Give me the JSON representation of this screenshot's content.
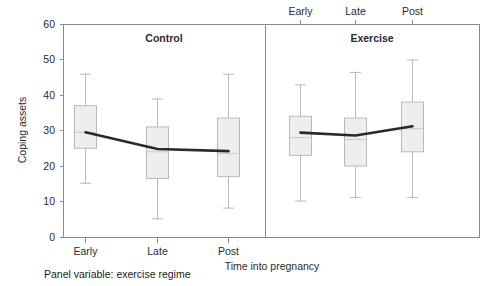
{
  "chart_data": {
    "type": "box",
    "title": "",
    "xlabel": "Time into pregnancy",
    "ylabel": "Coping assets",
    "ylim": [
      0,
      60
    ],
    "y_ticks": [
      0,
      10,
      20,
      30,
      40,
      50,
      60
    ],
    "categories": [
      "Early",
      "Late",
      "Post"
    ],
    "panel_variable_note": "Panel variable: exercise regime",
    "grid": false,
    "legend_position": "none",
    "panels": [
      {
        "name": "Control",
        "boxes": [
          {
            "category": "Early",
            "lower_whisker": 15,
            "q1": 25,
            "median": 29.5,
            "q3": 37,
            "upper_whisker": 46,
            "mean": 29.5
          },
          {
            "category": "Late",
            "lower_whisker": 5,
            "q1": 16.5,
            "median": 24,
            "q3": 31,
            "upper_whisker": 39,
            "mean": 24.8
          },
          {
            "category": "Post",
            "lower_whisker": 8,
            "q1": 17,
            "median": 23.5,
            "q3": 33.5,
            "upper_whisker": 46,
            "mean": 24.2
          }
        ],
        "mean_series": [
          29.5,
          24.8,
          24.2
        ]
      },
      {
        "name": "Exercise",
        "boxes": [
          {
            "category": "Early",
            "lower_whisker": 10,
            "q1": 23,
            "median": 28,
            "q3": 34,
            "upper_whisker": 43,
            "mean": 29.4
          },
          {
            "category": "Late",
            "lower_whisker": 11,
            "q1": 20,
            "median": 27.5,
            "q3": 33.5,
            "upper_whisker": 46.5,
            "mean": 28.6
          },
          {
            "category": "Post",
            "lower_whisker": 11,
            "q1": 24,
            "median": 30.5,
            "q3": 38,
            "upper_whisker": 50,
            "mean": 31.2
          }
        ],
        "mean_series": [
          29.4,
          28.6,
          31.2
        ]
      }
    ]
  },
  "axis": {
    "y_label": "Coping assets",
    "x_label": "Time into pregnancy",
    "y_tick_60": "60",
    "y_tick_50": "50",
    "y_tick_40": "40",
    "y_tick_30": "30",
    "y_tick_20": "20",
    "y_tick_10": "10",
    "y_tick_0": "0"
  },
  "panels": {
    "left_title": "Control",
    "right_title": "Exercise",
    "left_ticks": [
      "Early",
      "Late",
      "Post"
    ],
    "right_ticks": [
      "Early",
      "Late",
      "Post"
    ]
  },
  "footer": {
    "panel_note": "Panel variable: exercise regime"
  },
  "colors": {
    "box_fill": "#eeeeee",
    "box_stroke": "#b9b9b9",
    "frame": "#8a8a8a",
    "mean_line": "#2a2a2a",
    "text": "#2b2b2b",
    "background": "#ffffff"
  }
}
